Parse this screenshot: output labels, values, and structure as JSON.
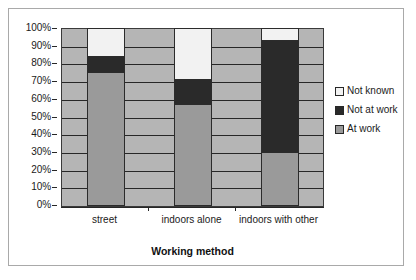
{
  "chart_data": {
    "type": "bar",
    "stacked": true,
    "normalized": "100%",
    "title": "",
    "xlabel": "Working method",
    "ylabel": "",
    "categories": [
      "street",
      "indoors alone",
      "indoors with other"
    ],
    "series": [
      {
        "name": "At work",
        "color": "#9a9a9a",
        "values": [
          75,
          57,
          30
        ]
      },
      {
        "name": "Not at work",
        "color": "#2a2a2a",
        "values": [
          9,
          14,
          63
        ]
      },
      {
        "name": "Not known",
        "color": "#f2f2f2",
        "values": [
          16,
          29,
          7
        ]
      }
    ],
    "ylim": [
      0,
      100
    ],
    "yticks": [
      "0%",
      "10%",
      "20%",
      "30%",
      "40%",
      "50%",
      "60%",
      "70%",
      "80%",
      "90%",
      "100%"
    ],
    "ytick_values": [
      0,
      10,
      20,
      30,
      40,
      50,
      60,
      70,
      80,
      90,
      100
    ],
    "grid": true,
    "legend_position": "right",
    "plot_background": "#b5b5b5",
    "frame_color": "#a9a9a9"
  },
  "legend": {
    "items": [
      {
        "label": "Not known",
        "color": "#f2f2f2"
      },
      {
        "label": "Not at work",
        "color": "#2a2a2a"
      },
      {
        "label": "At work",
        "color": "#9a9a9a"
      }
    ]
  },
  "axis": {
    "x_title": "Working method"
  }
}
